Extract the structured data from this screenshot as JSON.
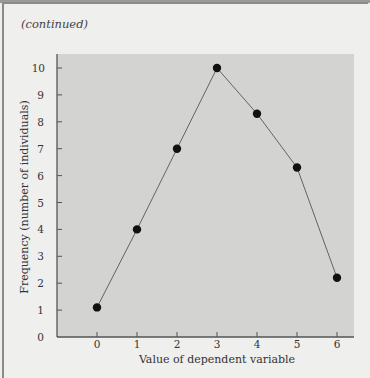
{
  "header": {
    "label": "(continued)"
  },
  "chart_data": {
    "type": "line",
    "title": "",
    "xlabel": "Value of dependent variable",
    "ylabel": "Frequency (number of individuals)",
    "x": [
      0,
      1,
      2,
      3,
      4,
      5,
      6
    ],
    "values": [
      1.1,
      4,
      7,
      10,
      8.3,
      6.3,
      2.2
    ],
    "xticks": [
      "0",
      "1",
      "2",
      "3",
      "4",
      "5",
      "6"
    ],
    "yticks": [
      "0",
      "1",
      "2",
      "3",
      "4",
      "5",
      "6",
      "7",
      "8",
      "9",
      "10"
    ],
    "xlim": [
      -1,
      7.3
    ],
    "ylim": [
      0,
      10.5
    ],
    "grid": false,
    "markers": true,
    "colors": {
      "plot_bg": "#d3d3d1",
      "page_bg": "#eeeeec",
      "line": "#555555",
      "marker": "#111111"
    }
  }
}
